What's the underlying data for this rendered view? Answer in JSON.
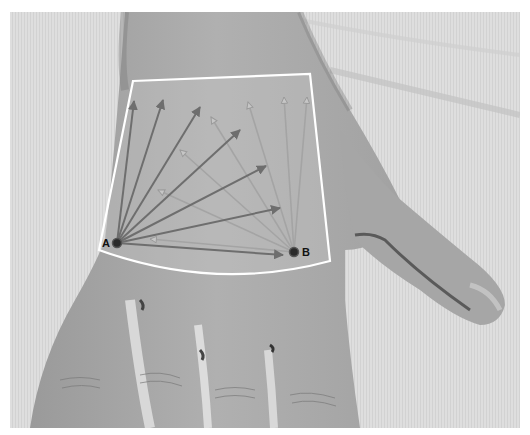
{
  "figure": {
    "points": [
      {
        "id": "A",
        "label": "A",
        "x": 117,
        "y": 243
      },
      {
        "id": "B",
        "label": "B",
        "x": 294,
        "y": 252
      }
    ],
    "region": {
      "shape": "curved-trapezoid",
      "corners": {
        "top_left": [
          133,
          81
        ],
        "top_right": [
          310,
          74
        ],
        "bottom_right": [
          330,
          261
        ],
        "bottom_left": [
          99,
          250
        ]
      },
      "outline_color": "#ffffff"
    },
    "arrows_from_A": {
      "color": "#6e6e6e",
      "style": "solid-head",
      "tips": [
        [
          134,
          101
        ],
        [
          163,
          100
        ],
        [
          200,
          107
        ],
        [
          240,
          130
        ],
        [
          266,
          166
        ],
        [
          280,
          208
        ],
        [
          283,
          255
        ]
      ]
    },
    "arrows_from_B": {
      "color": "#a8a8a8",
      "style": "open-head",
      "tips": [
        [
          307,
          97
        ],
        [
          284,
          97
        ],
        [
          248,
          102
        ],
        [
          211,
          117
        ],
        [
          180,
          150
        ],
        [
          158,
          190
        ],
        [
          150,
          239
        ]
      ]
    },
    "colors": {
      "background_cloth": "#dcdcdc",
      "skin": "#a9a9a9",
      "shadow": "#555555",
      "point_fill": "#2a2a2a"
    }
  }
}
